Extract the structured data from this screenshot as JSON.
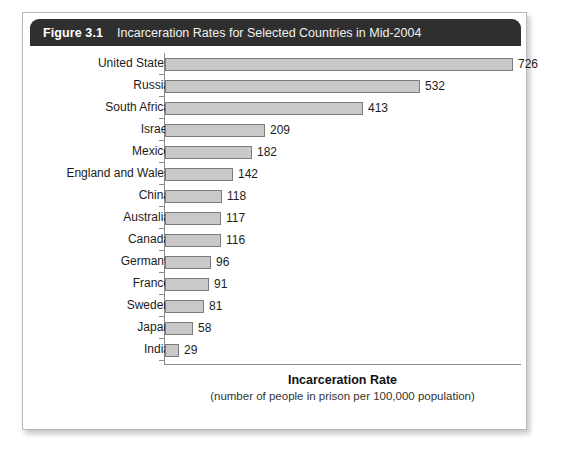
{
  "figure": {
    "number": "Figure 3.1",
    "caption": "Incarceration Rates for Selected Countries in Mid-2004"
  },
  "axis": {
    "title": "Incarceration Rate",
    "subtitle": "(number of people in prison per 100,000 population)"
  },
  "colors": {
    "header_background": "#2f2f2f",
    "header_text": "#ffffff",
    "bar_fill": "#c9c9c9",
    "bar_border": "#7d7d7d",
    "axis_line": "#8b8b8b",
    "card_background": "#ffffff"
  },
  "chart_data": {
    "type": "bar",
    "orientation": "horizontal",
    "title": "Incarceration Rates for Selected Countries in Mid-2004",
    "xlabel": "Incarceration Rate",
    "xlabel_note": "(number of people in prison per 100,000 population)",
    "ylabel": "",
    "grid": false,
    "legend": false,
    "xlim": [
      0,
      726
    ],
    "categories": [
      "United States",
      "Russia",
      "South Africa",
      "Israel",
      "Mexico",
      "England and Wales",
      "China",
      "Australia",
      "Canada",
      "Germany",
      "France",
      "Sweden",
      "Japan",
      "India"
    ],
    "values": [
      726,
      532,
      413,
      209,
      182,
      142,
      118,
      117,
      116,
      96,
      91,
      81,
      58,
      29
    ]
  }
}
